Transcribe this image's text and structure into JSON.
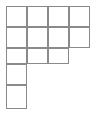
{
  "figure": {
    "kind": "polyomino-grid",
    "canvas": {
      "width": 98,
      "height": 115,
      "background": "#ffffff"
    },
    "grid": {
      "origin_x": 6,
      "origin_y": 6,
      "cell_width": 21,
      "cell_height": 21,
      "last_row_height": 24,
      "row3_height": 16,
      "columns": 4,
      "rows": 5,
      "total_cells": 13,
      "stroke_color": "#8a8a8a",
      "stroke_width": 1.6,
      "fill_color": "#ffffff"
    },
    "rows": [
      {
        "index": 1,
        "label": "row-1",
        "filled_columns": 4,
        "cells": [
          1,
          2,
          3,
          4
        ]
      },
      {
        "index": 2,
        "label": "row-2",
        "filled_columns": 4,
        "cells": [
          1,
          2,
          3,
          4
        ]
      },
      {
        "index": 3,
        "label": "row-3",
        "filled_columns": 3,
        "cells": [
          1,
          2,
          3
        ]
      },
      {
        "index": 4,
        "label": "row-4",
        "filled_columns": 1,
        "cells": [
          1
        ]
      },
      {
        "index": 5,
        "label": "row-5",
        "filled_columns": 1,
        "cells": [
          1
        ]
      }
    ],
    "cells": [
      {
        "id": "r1c1",
        "row": 1,
        "col": 1,
        "x": 6,
        "y": 6,
        "w": 21,
        "h": 21
      },
      {
        "id": "r1c2",
        "row": 1,
        "col": 2,
        "x": 27,
        "y": 6,
        "w": 21,
        "h": 21
      },
      {
        "id": "r1c3",
        "row": 1,
        "col": 3,
        "x": 48,
        "y": 6,
        "w": 21,
        "h": 21
      },
      {
        "id": "r1c4",
        "row": 1,
        "col": 4,
        "x": 69,
        "y": 6,
        "w": 21,
        "h": 21
      },
      {
        "id": "r2c1",
        "row": 2,
        "col": 1,
        "x": 6,
        "y": 27,
        "w": 21,
        "h": 21
      },
      {
        "id": "r2c2",
        "row": 2,
        "col": 2,
        "x": 27,
        "y": 27,
        "w": 21,
        "h": 21
      },
      {
        "id": "r2c3",
        "row": 2,
        "col": 3,
        "x": 48,
        "y": 27,
        "w": 21,
        "h": 21
      },
      {
        "id": "r2c4",
        "row": 2,
        "col": 4,
        "x": 69,
        "y": 27,
        "w": 21,
        "h": 21
      },
      {
        "id": "r3c1",
        "row": 3,
        "col": 1,
        "x": 6,
        "y": 48,
        "w": 21,
        "h": 16
      },
      {
        "id": "r3c2",
        "row": 3,
        "col": 2,
        "x": 27,
        "y": 48,
        "w": 21,
        "h": 16
      },
      {
        "id": "r3c3",
        "row": 3,
        "col": 3,
        "x": 48,
        "y": 48,
        "w": 21,
        "h": 16
      },
      {
        "id": "r4c1",
        "row": 4,
        "col": 1,
        "x": 6,
        "y": 64,
        "w": 21,
        "h": 21
      },
      {
        "id": "r5c1",
        "row": 5,
        "col": 1,
        "x": 6,
        "y": 85,
        "w": 21,
        "h": 24
      }
    ]
  }
}
